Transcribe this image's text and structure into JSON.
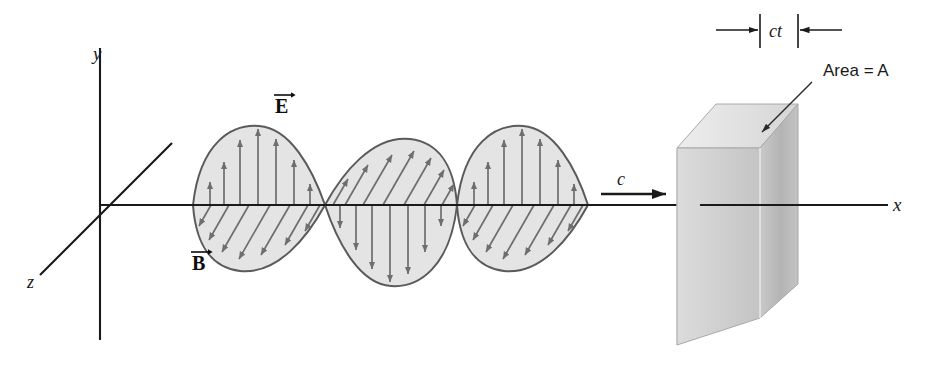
{
  "figure": {
    "background": "#ffffff",
    "ink": "#1a1a1a"
  },
  "axes": {
    "x_label": "x",
    "y_label": "y",
    "z_label": "z",
    "origin": {
      "x": 100,
      "y": 205
    },
    "x_axis_end": {
      "x": 888,
      "y": 205
    },
    "y_axis_top": {
      "x": 100,
      "y": 48
    },
    "y_axis_bottom": {
      "x": 100,
      "y": 340
    },
    "z_axis_near": {
      "x": 40,
      "y": 275
    },
    "z_axis_far": {
      "x": 172,
      "y": 143
    }
  },
  "fields": {
    "E_label": "E",
    "B_label": "B",
    "E_label_pos": {
      "x": 282,
      "y": 105
    },
    "B_label_pos": {
      "x": 199,
      "y": 262
    },
    "E_description": "Electric field vectors, vertical, along y",
    "B_description": "Magnetic field vectors, oblique, along z",
    "arrow_color": "#6e6e6e",
    "lobe_fill": "#e2e2e2",
    "lobe_stroke": "#5a5a5a"
  },
  "wave": {
    "start_x": 193,
    "end_x": 588,
    "baseline_y": 205,
    "amplitude": 80,
    "half_cycles": 3,
    "lobes": [
      {
        "index": 1,
        "sign": "up",
        "x_start": 193,
        "x_end": 325,
        "E_direction": "up",
        "B_direction": "down-left"
      },
      {
        "index": 2,
        "sign": "down",
        "x_start": 325,
        "x_end": 457,
        "E_direction": "down",
        "B_direction": "up-right"
      },
      {
        "index": 3,
        "sign": "up",
        "x_start": 457,
        "x_end": 588,
        "E_direction": "up",
        "B_direction": "down-left"
      }
    ]
  },
  "propagation": {
    "speed_label": "c",
    "label_pos": {
      "x": 622,
      "y": 180
    },
    "arrow_start": {
      "x": 601,
      "y": 194
    },
    "arrow_end": {
      "x": 668,
      "y": 194
    }
  },
  "slab": {
    "thickness_label": "ct",
    "area_label": "Area = A",
    "thickness_label_pos": {
      "x": 779,
      "y": 30
    },
    "area_label_pos": {
      "x": 830,
      "y": 70
    },
    "front_face_fill": "#b9b9b9",
    "side_face_fill": "#cfcfcf",
    "top_face_fill": "#e3e3e3",
    "edge_color": "#9a9a9a",
    "dimension_tick_left_x": 760,
    "dimension_tick_right_x": 798
  }
}
